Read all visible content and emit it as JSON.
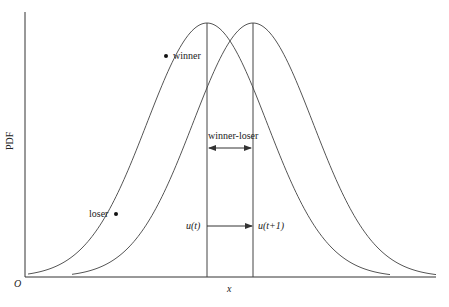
{
  "diagram": {
    "y_axis_label": "PDF",
    "x_axis_label": "x",
    "origin_label": "O",
    "curves": [
      {
        "name": "pdf-at-t",
        "peak_x": 207,
        "peak_y": 23,
        "sigma": 60
      },
      {
        "name": "pdf-at-t-plus-1",
        "peak_x": 253,
        "peak_y": 23,
        "sigma": 60
      }
    ],
    "points": {
      "winner": {
        "label": "winner"
      },
      "loser": {
        "label": "loser"
      }
    },
    "annotations": {
      "shift_label": "winner-loser",
      "mean_t": "u(t)",
      "mean_t_plus_1": "u(t+1)"
    },
    "colors": {
      "line": "#555555",
      "axis": "#333333",
      "dot": "#111111"
    }
  }
}
